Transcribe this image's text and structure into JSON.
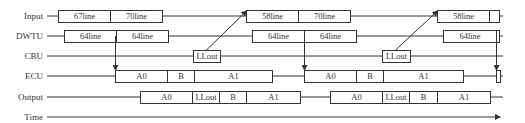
{
  "diagram": {
    "type": "timing-diagram",
    "rows": [
      {
        "id": "input",
        "label": "Input",
        "y": 16,
        "boxes": [
          {
            "x": 58,
            "w": 52,
            "text": "67line"
          },
          {
            "x": 110,
            "w": 52,
            "text": "70line"
          },
          {
            "x": 246,
            "w": 52,
            "text": "58line"
          },
          {
            "x": 298,
            "w": 52,
            "text": "70line"
          },
          {
            "x": 437,
            "w": 52,
            "text": "58line"
          },
          {
            "x": 489,
            "w": 10,
            "text": ""
          }
        ]
      },
      {
        "id": "dwtu",
        "label": "DWTU",
        "y": 36,
        "boxes": [
          {
            "x": 64,
            "w": 52,
            "text": "64line"
          },
          {
            "x": 116,
            "w": 52,
            "text": "64line"
          },
          {
            "x": 252,
            "w": 52,
            "text": "64line"
          },
          {
            "x": 304,
            "w": 52,
            "text": "64line"
          },
          {
            "x": 443,
            "w": 53,
            "text": "64line"
          },
          {
            "x": 496,
            "w": 3,
            "text": ""
          }
        ]
      },
      {
        "id": "cbu",
        "label": "CBU",
        "y": 56,
        "boxes": [
          {
            "x": 193,
            "w": 27,
            "text": "LLout"
          },
          {
            "x": 382,
            "w": 28,
            "text": "LLout"
          }
        ]
      },
      {
        "id": "ecu",
        "label": "ECU",
        "y": 76,
        "boxes": [
          {
            "x": 115,
            "w": 52,
            "text": "A0"
          },
          {
            "x": 167,
            "w": 27,
            "text": "B"
          },
          {
            "x": 194,
            "w": 78,
            "text": "A1"
          },
          {
            "x": 304,
            "w": 52,
            "text": "A0"
          },
          {
            "x": 356,
            "w": 27,
            "text": "B"
          },
          {
            "x": 383,
            "w": 80,
            "text": "A1"
          },
          {
            "x": 496,
            "w": 4,
            "text": ""
          }
        ]
      },
      {
        "id": "output",
        "label": "Output",
        "y": 97,
        "boxes": [
          {
            "x": 140,
            "w": 52,
            "text": "A0"
          },
          {
            "x": 192,
            "w": 27,
            "text": "LLout"
          },
          {
            "x": 219,
            "w": 27,
            "text": "B"
          },
          {
            "x": 246,
            "w": 54,
            "text": "A1"
          },
          {
            "x": 330,
            "w": 52,
            "text": "A0"
          },
          {
            "x": 382,
            "w": 27,
            "text": "LLout"
          },
          {
            "x": 409,
            "w": 28,
            "text": "B"
          },
          {
            "x": 437,
            "w": 53,
            "text": "A1"
          }
        ]
      },
      {
        "id": "time",
        "label": "Time",
        "y": 117,
        "boxes": []
      }
    ],
    "arrows": [
      {
        "from": [
          115,
          36
        ],
        "to": [
          115,
          70
        ],
        "desc": "DWTU to ECU"
      },
      {
        "from": [
          205,
          51
        ],
        "to": [
          246,
          11
        ],
        "desc": "CBU LLout to Input 58line"
      },
      {
        "from": [
          304,
          36
        ],
        "to": [
          304,
          70
        ],
        "desc": "DWTU to ECU"
      },
      {
        "from": [
          394,
          51
        ],
        "to": [
          437,
          11
        ],
        "desc": "CBU LLout to Input 58line"
      },
      {
        "from": [
          496,
          36
        ],
        "to": [
          496,
          70
        ],
        "desc": "DWTU to ECU"
      }
    ],
    "colors": {
      "stroke": "#333333",
      "background": "#ffffff"
    }
  }
}
